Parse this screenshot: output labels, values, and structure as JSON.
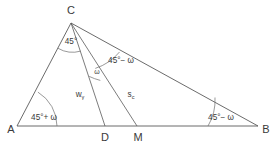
{
  "figure": {
    "type": "geometry-diagram",
    "stroke_color": "#5a5a5a",
    "text_color": "#3a3a3a",
    "background_color": "#ffffff"
  },
  "vertices": [
    {
      "id": "A",
      "label": "A",
      "x": 17,
      "y": 126
    },
    {
      "id": "B",
      "label": "B",
      "x": 258,
      "y": 126
    },
    {
      "id": "C",
      "label": "C",
      "x": 71,
      "y": 23
    },
    {
      "id": "D",
      "label": "D",
      "x": 105,
      "y": 126
    },
    {
      "id": "M",
      "label": "M",
      "x": 137,
      "y": 126
    }
  ],
  "vertex_labels": {
    "A": "A",
    "B": "B",
    "C": "C",
    "D": "D",
    "M": "M"
  },
  "angles": [
    {
      "id": "angle-at-A",
      "label": "45°+ ω",
      "vertex": "A",
      "value": "45°+ ω"
    },
    {
      "id": "angle-at-B",
      "label": "45°− ω",
      "vertex": "B",
      "value": "45°− ω"
    },
    {
      "id": "angle-acd",
      "label": "45°",
      "vertex": "C",
      "value": "45°"
    },
    {
      "id": "angle-dcm",
      "label": "ω",
      "vertex": "C",
      "value": "ω"
    },
    {
      "id": "angle-mcb",
      "label": "45°− ω",
      "vertex": "C",
      "value": "45°− ω"
    }
  ],
  "segments": [
    {
      "id": "segment-cd",
      "label": "w",
      "subscript": "γ",
      "from": "C",
      "to": "D"
    },
    {
      "id": "segment-cm",
      "label": "s",
      "subscript": "c",
      "from": "C",
      "to": "M"
    }
  ],
  "edges": [
    {
      "id": "edge-ab",
      "from": "A",
      "to": "B"
    },
    {
      "id": "edge-ac",
      "from": "A",
      "to": "C"
    },
    {
      "id": "edge-cb",
      "from": "C",
      "to": "B"
    },
    {
      "id": "edge-cd",
      "from": "C",
      "to": "D"
    },
    {
      "id": "edge-cm",
      "from": "C",
      "to": "M"
    }
  ]
}
